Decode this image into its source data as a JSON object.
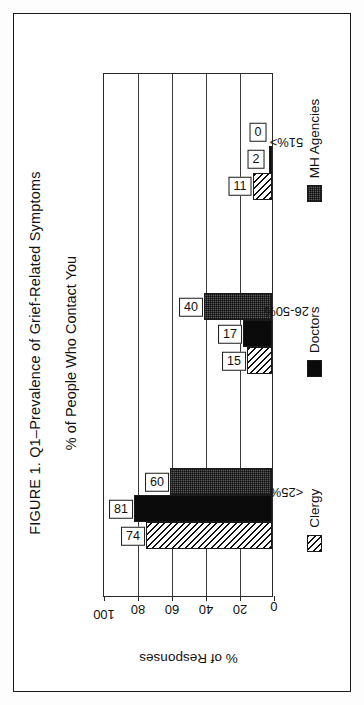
{
  "figure": {
    "title": "FIGURE 1. Q1–Prevalence of Grief-Related Symptoms",
    "subtitle": "% of People Who Contact You"
  },
  "chart_data": {
    "type": "bar",
    "title": "FIGURE 1. Q1–Prevalence of Grief-Related Symptoms",
    "subtitle": "% of People Who Contact You",
    "xlabel": "",
    "ylabel": "% of Responses",
    "ylim": [
      0,
      100
    ],
    "yticks": [
      0,
      20,
      40,
      60,
      80,
      100
    ],
    "ytick_labels": [
      "0",
      "20",
      "40",
      "60",
      "80",
      "100"
    ],
    "grid": true,
    "orientation": "vertical-bars-rotated-page",
    "legend_position": "bottom",
    "categories": [
      "<25%",
      "26-50%",
      "51%>"
    ],
    "series": [
      {
        "name": "Clergy",
        "pattern": "diagonal-hatch",
        "color": "#ffffff",
        "values": [
          74,
          15,
          11
        ]
      },
      {
        "name": "Doctors",
        "pattern": "solid",
        "color": "#0b0b0b",
        "values": [
          81,
          17,
          2
        ]
      },
      {
        "name": "MH Agencies",
        "pattern": "dotted",
        "color": "#5b5b5b",
        "values": [
          60,
          40,
          0
        ]
      }
    ]
  },
  "axis": {
    "y_title": "% of Responses",
    "ticks": [
      "100",
      "80",
      "60",
      "40",
      "20",
      "0"
    ]
  },
  "legend": {
    "items": [
      {
        "label": "Clergy"
      },
      {
        "label": "Doctors"
      },
      {
        "label": "MH Agencies"
      }
    ]
  }
}
